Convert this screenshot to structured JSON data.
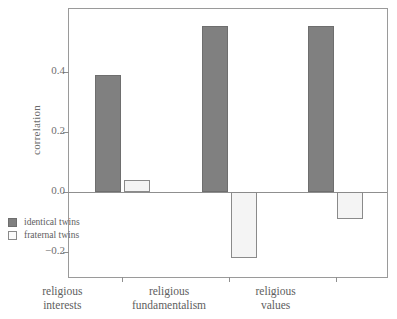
{
  "chart_data": {
    "type": "bar",
    "title": "",
    "xlabel": "",
    "ylabel": "correlation",
    "categories": [
      "religious\ninterests",
      "religious\nfundamentalism",
      "religious\nvalues"
    ],
    "series": [
      {
        "name": "identical twins",
        "values": [
          0.39,
          0.555,
          0.555
        ],
        "color": "#808080"
      },
      {
        "name": "fraternal twins",
        "values": [
          0.04,
          -0.22,
          -0.09
        ],
        "color": "#f4f4f4"
      }
    ],
    "ylim": [
      -0.29,
      0.61
    ],
    "yticks": [
      0.4,
      0.2,
      0.0,
      -0.2
    ],
    "ytick_labels": [
      "0.4",
      "0.2",
      "0.0",
      "−0.2"
    ],
    "grid": false,
    "legend_position": "bottom-left-inside",
    "zero_line": true
  },
  "legend": {
    "items": [
      {
        "label": "identical twins",
        "swatch": "identical"
      },
      {
        "label": "fraternal twins",
        "swatch": "fraternal"
      }
    ]
  },
  "axes": {
    "ylabel": "correlation"
  }
}
